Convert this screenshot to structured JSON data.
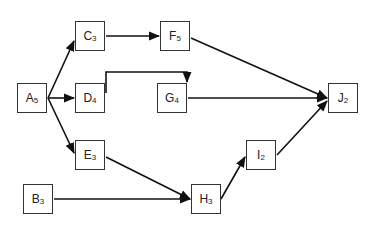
{
  "diagram": {
    "type": "activity-on-node network",
    "nodes": [
      {
        "id": "A",
        "label": "A",
        "duration": "5",
        "x": 17,
        "y": 83
      },
      {
        "id": "C",
        "label": "C",
        "duration": "3",
        "x": 75,
        "y": 21
      },
      {
        "id": "D",
        "label": "D",
        "duration": "4",
        "x": 75,
        "y": 83
      },
      {
        "id": "E",
        "label": "E",
        "duration": "3",
        "x": 75,
        "y": 140
      },
      {
        "id": "B",
        "label": "B",
        "duration": "3",
        "x": 23,
        "y": 184
      },
      {
        "id": "F",
        "label": "F",
        "duration": "5",
        "x": 160,
        "y": 21
      },
      {
        "id": "G",
        "label": "G",
        "duration": "4",
        "x": 157,
        "y": 83
      },
      {
        "id": "H",
        "label": "H",
        "duration": "3",
        "x": 191,
        "y": 184
      },
      {
        "id": "I",
        "label": "I",
        "duration": "2",
        "x": 246,
        "y": 140
      },
      {
        "id": "J",
        "label": "J",
        "duration": "2",
        "x": 328,
        "y": 83
      }
    ],
    "edges": [
      {
        "from": "A",
        "to": "C"
      },
      {
        "from": "A",
        "to": "D"
      },
      {
        "from": "A",
        "to": "E"
      },
      {
        "from": "C",
        "to": "F"
      },
      {
        "from": "D",
        "to": "G"
      },
      {
        "from": "F",
        "to": "J"
      },
      {
        "from": "G",
        "to": "J"
      },
      {
        "from": "E",
        "to": "H"
      },
      {
        "from": "B",
        "to": "H"
      },
      {
        "from": "H",
        "to": "I"
      },
      {
        "from": "I",
        "to": "J"
      }
    ]
  }
}
